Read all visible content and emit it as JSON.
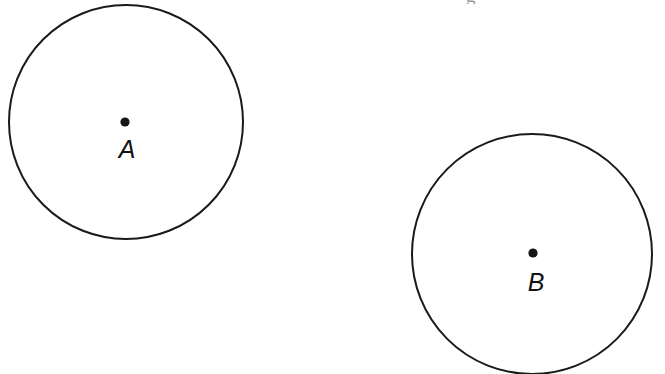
{
  "figure": {
    "background_color": "#ffffff",
    "stroke_color": "#1a1a1a",
    "dot_color": "#161616",
    "label_color": "#111111",
    "stroke_width": 2,
    "width": 665,
    "height": 374
  },
  "circles": [
    {
      "id": "circle-a",
      "label": "A",
      "center_x": 126,
      "center_y": 122,
      "radius": 117,
      "dot_radius": 4.5,
      "label_x": 127,
      "label_y": 158
    },
    {
      "id": "circle-b",
      "label": "B",
      "center_x": 532,
      "center_y": 254,
      "radius": 120,
      "dot_radius": 4.5,
      "label_x": 536,
      "label_y": 291
    }
  ],
  "artifacts": {
    "cropped_text_fragment": "g",
    "fragment_x": 466,
    "fragment_y": -14
  }
}
